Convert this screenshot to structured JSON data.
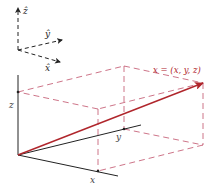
{
  "diagram": {
    "unit_vectors": {
      "z_hat": "ẑ",
      "y_hat": "ŷ",
      "x_hat": "x̂"
    },
    "axes": {
      "x_label": "x",
      "y_label": "y",
      "z_label": "z"
    },
    "vector": {
      "label": "x = (x, y, z)",
      "color": "#b0262c"
    },
    "colors": {
      "axis": "#222222",
      "dashed_box": "#c0506a",
      "vector": "#b0262c"
    }
  }
}
